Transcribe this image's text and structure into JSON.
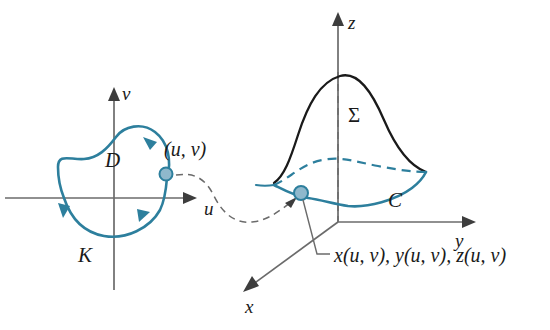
{
  "figure": {
    "colors": {
      "blue_curve": "#2d7f9d",
      "black_curve": "#1a1a1a",
      "axis_gray": "#6b6b6b",
      "dot_fill": "#8fb8cc",
      "background": "#ffffff"
    }
  },
  "uv_plane": {
    "axis_u_label": "u",
    "axis_v_label": "v",
    "region_label": "D",
    "boundary_curve_label": "K",
    "point_label": "(u, v)"
  },
  "xyz_space": {
    "axis_x_label": "x",
    "axis_y_label": "y",
    "axis_z_label": "z",
    "surface_label": "Σ",
    "boundary_curve_label": "C",
    "point_label": "x(u, v), y(u, v), z(u, v)"
  }
}
